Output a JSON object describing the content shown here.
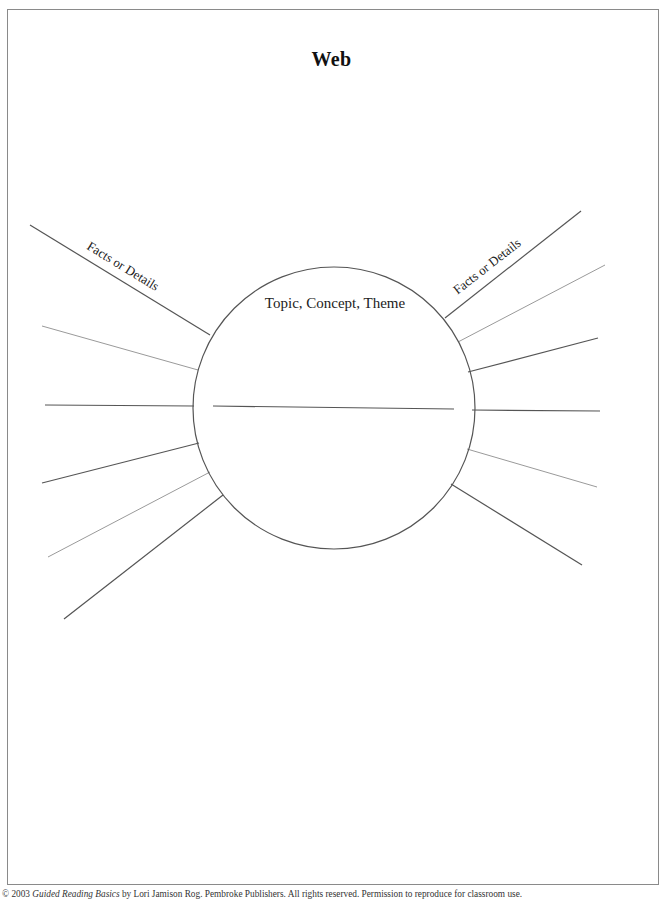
{
  "page": {
    "title": "Web",
    "center_label": "Topic, Concept, Theme",
    "left_label": "Facts or Details",
    "right_label": "Facts or Details"
  },
  "footer": {
    "prefix": "© 2003 ",
    "book_title": "Guided Reading Basics",
    "suffix": " by Lori Jamison Rog. Pembroke Publishers. All rights reserved. Permission to reproduce for classroom use."
  },
  "diagram": {
    "center_circle": {
      "cx": 334,
      "cy": 408,
      "r": 141
    },
    "center_line": {
      "x1": 213,
      "y1": 406,
      "x2": 454,
      "y2": 409
    },
    "left_spokes": [
      {
        "x1": 30,
        "y1": 225,
        "x2": 210,
        "y2": 335,
        "tone": "dark"
      },
      {
        "x1": 42,
        "y1": 326,
        "x2": 198,
        "y2": 370,
        "tone": "light"
      },
      {
        "x1": 45,
        "y1": 405,
        "x2": 194,
        "y2": 406,
        "tone": "dark"
      },
      {
        "x1": 42,
        "y1": 483,
        "x2": 199,
        "y2": 443,
        "tone": "dark"
      },
      {
        "x1": 48,
        "y1": 557,
        "x2": 210,
        "y2": 472,
        "tone": "light"
      },
      {
        "x1": 64,
        "y1": 619,
        "x2": 223,
        "y2": 495,
        "tone": "dark"
      }
    ],
    "right_spokes": [
      {
        "x1": 445,
        "y1": 318,
        "x2": 581,
        "y2": 211,
        "tone": "dark"
      },
      {
        "x1": 458,
        "y1": 342,
        "x2": 605,
        "y2": 265,
        "tone": "light"
      },
      {
        "x1": 468,
        "y1": 372,
        "x2": 598,
        "y2": 338,
        "tone": "dark"
      },
      {
        "x1": 472,
        "y1": 410,
        "x2": 600,
        "y2": 411,
        "tone": "dark"
      },
      {
        "x1": 467,
        "y1": 449,
        "x2": 597,
        "y2": 487,
        "tone": "light"
      },
      {
        "x1": 451,
        "y1": 484,
        "x2": 582,
        "y2": 565,
        "tone": "dark"
      }
    ],
    "colors": {
      "dark": "#555555",
      "light": "#9a9a9a",
      "circle": "#555555"
    }
  }
}
